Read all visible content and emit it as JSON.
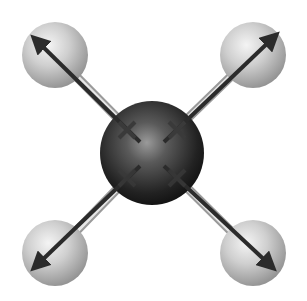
{
  "diagram": {
    "central_atom": {
      "cx": 152,
      "cy": 153,
      "r": 52,
      "color": "#2a2a2a"
    },
    "outer_atoms": [
      {
        "id": "top-left",
        "cx": 55,
        "cy": 55,
        "r": 33,
        "arrow_tip": [
          32,
          36
        ]
      },
      {
        "id": "top-right",
        "cx": 253,
        "cy": 55,
        "r": 33,
        "arrow_tip": [
          278,
          33
        ]
      },
      {
        "id": "bottom-left",
        "cx": 55,
        "cy": 253,
        "r": 33,
        "arrow_tip": [
          32,
          270
        ]
      },
      {
        "id": "bottom-right",
        "cx": 253,
        "cy": 253,
        "r": 33,
        "arrow_tip": [
          275,
          270
        ]
      }
    ],
    "dipole_plus_marks": [
      {
        "x": 127,
        "y": 130
      },
      {
        "x": 177,
        "y": 130
      },
      {
        "x": 127,
        "y": 178
      },
      {
        "x": 177,
        "y": 178
      }
    ],
    "colors": {
      "outer_atom": "#bdbdbd",
      "bond_rod": "#d8d8d8",
      "arrow": "#2b2b2b",
      "background": "#ffffff"
    }
  }
}
